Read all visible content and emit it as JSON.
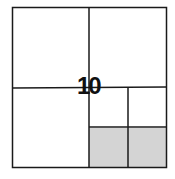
{
  "diagram": {
    "label": "10",
    "shaded_color": "#d4d4d4",
    "line_color": "#1a1a1a"
  }
}
